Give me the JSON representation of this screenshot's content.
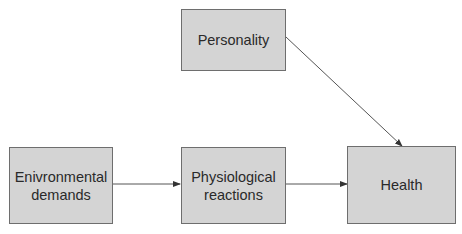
{
  "diagram": {
    "nodes": [
      {
        "id": "personality",
        "label": "Personality"
      },
      {
        "id": "environmental",
        "label": "Enivronmental demands"
      },
      {
        "id": "physiological",
        "label": "Physiological reactions"
      },
      {
        "id": "health",
        "label": "Health"
      }
    ],
    "edges": [
      {
        "from": "environmental",
        "to": "physiological"
      },
      {
        "from": "physiological",
        "to": "health"
      },
      {
        "from": "personality",
        "to": "health"
      }
    ],
    "colors": {
      "box_fill": "#d4d4d4",
      "box_border": "#6e6e6e",
      "arrow": "#333333"
    }
  }
}
